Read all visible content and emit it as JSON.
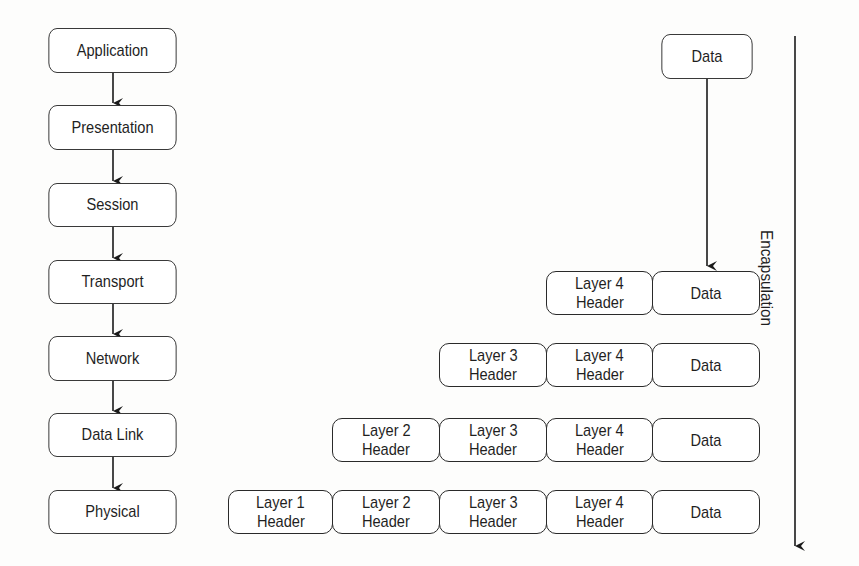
{
  "osi_layers": [
    {
      "label": "Application"
    },
    {
      "label": "Presentation"
    },
    {
      "label": "Session"
    },
    {
      "label": "Transport"
    },
    {
      "label": "Network"
    },
    {
      "label": "Data Link"
    },
    {
      "label": "Physical"
    }
  ],
  "top_data": {
    "label": "Data"
  },
  "encapsulation": {
    "label": "Encapsulation"
  },
  "rows": [
    {
      "segments": [
        {
          "line1": "Layer 4",
          "line2": "Header"
        },
        {
          "line1": "Data",
          "line2": ""
        }
      ]
    },
    {
      "segments": [
        {
          "line1": "Layer 3",
          "line2": "Header"
        },
        {
          "line1": "Layer 4",
          "line2": "Header"
        },
        {
          "line1": "Data",
          "line2": ""
        }
      ]
    },
    {
      "segments": [
        {
          "line1": "Layer 2",
          "line2": "Header"
        },
        {
          "line1": "Layer 3",
          "line2": "Header"
        },
        {
          "line1": "Layer 4",
          "line2": "Header"
        },
        {
          "line1": "Data",
          "line2": ""
        }
      ]
    },
    {
      "segments": [
        {
          "line1": "Layer 1",
          "line2": "Header"
        },
        {
          "line1": "Layer 2",
          "line2": "Header"
        },
        {
          "line1": "Layer 3",
          "line2": "Header"
        },
        {
          "line1": "Layer 4",
          "line2": "Header"
        },
        {
          "line1": "Data",
          "line2": ""
        }
      ]
    }
  ]
}
